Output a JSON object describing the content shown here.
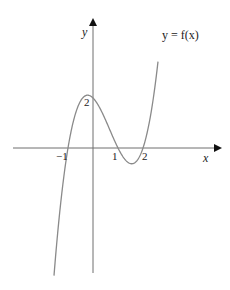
{
  "chart_data": {
    "type": "line",
    "title": "",
    "curve_label": "y = f(x)",
    "function": "f(x) = (x + 1)(x - 1)(x - 2)",
    "xlabel": "x",
    "ylabel": "y",
    "x_ticks": [
      {
        "value": -1,
        "label": "−1"
      },
      {
        "value": 1,
        "label": "1"
      },
      {
        "value": 2,
        "label": "2"
      }
    ],
    "y_ticks": [
      {
        "value": 2,
        "label": "2"
      }
    ],
    "key_points": [
      {
        "x": -1,
        "y": 0
      },
      {
        "x": 0,
        "y": 2
      },
      {
        "x": 1,
        "y": 0
      },
      {
        "x": 2,
        "y": 0
      }
    ],
    "x_range": [
      -1.56,
      2.6
    ],
    "grid": false,
    "legend": "none",
    "colors": {
      "curve": "#8a8a8a",
      "axes": "#6e6e6e",
      "text": "#222222"
    }
  },
  "labels": {
    "y_axis": "y",
    "x_axis": "x",
    "curve": "y = f(x)",
    "tick_neg1": "−1",
    "tick_1": "1",
    "tick_2": "2",
    "tick_y2": "2"
  }
}
